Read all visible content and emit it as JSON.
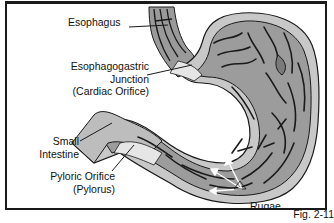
{
  "diagram": {
    "labels": {
      "esophagus": "Esophagus",
      "ej_line1": "Esophagogastric",
      "ej_line2": "Junction",
      "ej_line3": "(Cardiac Orifice)",
      "si_line1": "Small",
      "si_line2": "Intestine",
      "py_line1": "Pyloric Orifice",
      "py_line2": "(Pylorus)",
      "rugae": "Rugae"
    },
    "figure_label": "Fig. 2-11",
    "colors": {
      "stomach_fill": "#9c9c9c",
      "wall_fill": "#c4c4c4",
      "light_fill": "#e6e6e6",
      "lines": "#1a1a1a",
      "border": "#1a1a1a",
      "arrow_white": "#ffffff"
    }
  }
}
